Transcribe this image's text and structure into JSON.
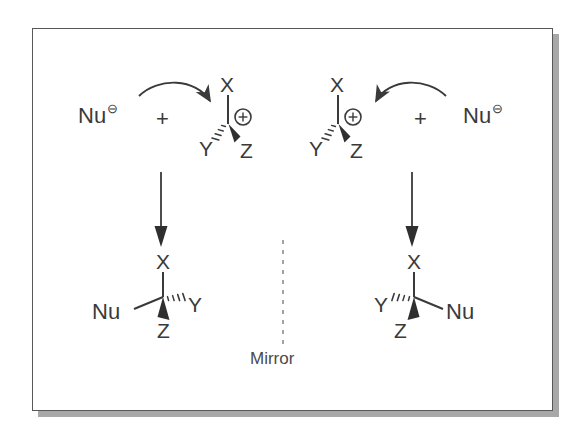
{
  "figure": {
    "type": "chemistry-reaction-scheme",
    "stroke_color": "#3a3a3a",
    "frame_color": "#585858",
    "shadow_color": "#a8a8a8",
    "background": "#ffffff"
  },
  "mirror": {
    "label": "Mirror"
  },
  "left_scheme": {
    "reactant_nucleophile": {
      "label": "Nu",
      "charge": "⊖"
    },
    "plus": "+",
    "cation": {
      "top_substituent": "X",
      "left_substituent": "Y",
      "right_substituent": "Z",
      "charge": "⊕"
    },
    "product": {
      "top_substituent": "X",
      "left_substituent": "Nu",
      "right_substituent": "Y",
      "bottom_substituent": "Z"
    }
  },
  "right_scheme": {
    "reactant_nucleophile": {
      "label": "Nu",
      "charge": "⊖"
    },
    "plus": "+",
    "cation": {
      "top_substituent": "X",
      "left_substituent": "Y",
      "right_substituent": "Z",
      "charge": "⊕"
    },
    "product": {
      "top_substituent": "X",
      "left_substituent": "Y",
      "right_substituent": "Nu",
      "bottom_substituent": "Z"
    }
  }
}
